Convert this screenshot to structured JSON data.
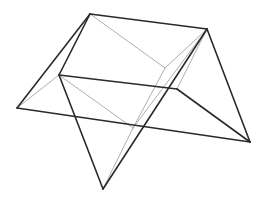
{
  "diagram": {
    "title": "",
    "colors": {
      "dark_edge": "#2a2a2a",
      "light_edge": "#9a9a9a",
      "background": "#ffffff"
    },
    "vertices": {
      "A": "top-left apex",
      "B": "top-right apex",
      "C": "inner-left vertex",
      "D": "inner-right vertex",
      "E": "far-left vertex",
      "F": "far-right vertex",
      "G": "bottom vertex",
      "H": "central interior vertex",
      "I": "upper interior vertex"
    },
    "edges_dark": [
      [
        "A",
        "B"
      ],
      [
        "A",
        "E"
      ],
      [
        "A",
        "C"
      ],
      [
        "C",
        "D"
      ],
      [
        "C",
        "G"
      ],
      [
        "E",
        "F"
      ],
      [
        "B",
        "F"
      ],
      [
        "D",
        "F"
      ],
      [
        "B",
        "G"
      ]
    ],
    "edges_light": [
      [
        "A",
        "I"
      ],
      [
        "I",
        "B"
      ],
      [
        "C",
        "H"
      ],
      [
        "I",
        "H"
      ],
      [
        "B",
        "H"
      ],
      [
        "H",
        "G"
      ],
      [
        "B",
        "D"
      ],
      [
        "E",
        "C"
      ]
    ]
  }
}
